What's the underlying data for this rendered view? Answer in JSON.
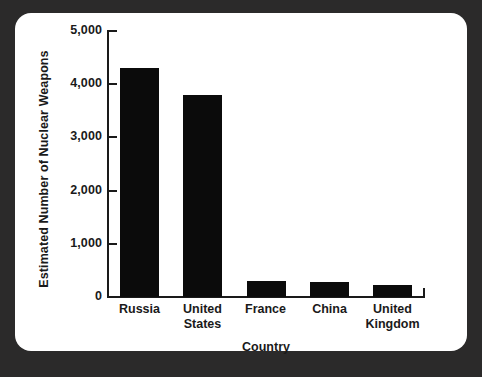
{
  "card": {
    "background_color": "#ffffff",
    "backdrop_color": "#2b2a2a"
  },
  "chart_data": {
    "type": "bar",
    "title": "",
    "xlabel": "Country",
    "ylabel": "Estimated Number of Nuclear Weapons",
    "categories": [
      "Russia",
      "United States",
      "France",
      "China",
      "United Kingdom"
    ],
    "values": [
      4300,
      3800,
      300,
      290,
      225
    ],
    "ylim": [
      0,
      5000
    ],
    "ytick_labels": [
      "5,000",
      "4,000",
      "3,000",
      "2,000",
      "1,000",
      "0"
    ],
    "ytick_values": [
      5000,
      4000,
      3000,
      2000,
      1000,
      0
    ],
    "grid": false,
    "legend": false,
    "bar_color": "#0b0b0b",
    "axis_color": "#1a1a1a"
  }
}
